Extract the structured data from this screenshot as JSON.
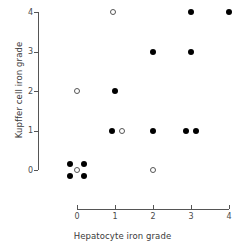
{
  "chart_data": {
    "type": "scatter",
    "title": "",
    "xlabel": "Hepatocyte iron grade",
    "ylabel": "Kupffer cell iron grade",
    "xlim": [
      0,
      4
    ],
    "ylim": [
      0,
      4
    ],
    "xticks": [
      "0",
      "1",
      "2",
      "3",
      "4"
    ],
    "yticks": [
      "0",
      "1",
      "2",
      "3",
      "4"
    ],
    "grid": false,
    "legend": "none",
    "series": [
      {
        "name": "filled-marker",
        "marker": "filled-circle",
        "color": "#000000",
        "points": [
          {
            "x": 0,
            "y": 0,
            "jx": -0.18,
            "jy": 0.16
          },
          {
            "x": 0,
            "y": 0,
            "jx": 0.18,
            "jy": 0.16
          },
          {
            "x": 0,
            "y": 0,
            "jx": -0.18,
            "jy": -0.16
          },
          {
            "x": 0,
            "y": 0,
            "jx": 0.18,
            "jy": -0.16
          },
          {
            "x": 1,
            "y": 1,
            "jx": -0.08,
            "jy": 0.0
          },
          {
            "x": 1,
            "y": 2,
            "jx": 0.0,
            "jy": 0.0
          },
          {
            "x": 2,
            "y": 1,
            "jx": 0.0,
            "jy": 0.0
          },
          {
            "x": 2,
            "y": 3,
            "jx": 0.0,
            "jy": 0.0
          },
          {
            "x": 3,
            "y": 1,
            "jx": -0.12,
            "jy": 0.0
          },
          {
            "x": 3,
            "y": 1,
            "jx": 0.14,
            "jy": 0.0
          },
          {
            "x": 3,
            "y": 3,
            "jx": 0.0,
            "jy": 0.0
          },
          {
            "x": 3,
            "y": 4,
            "jx": 0.0,
            "jy": 0.0
          },
          {
            "x": 4,
            "y": 4,
            "jx": 0.0,
            "jy": 0.0
          }
        ]
      },
      {
        "name": "open-marker",
        "marker": "open-circle",
        "color": "#555555",
        "points": [
          {
            "x": 0,
            "y": 0,
            "jx": 0.0,
            "jy": 0.0
          },
          {
            "x": 0,
            "y": 2,
            "jx": 0.0,
            "jy": 0.0
          },
          {
            "x": 1,
            "y": 1,
            "jx": 0.18,
            "jy": 0.0
          },
          {
            "x": 1,
            "y": 4,
            "jx": -0.06,
            "jy": 0.0
          },
          {
            "x": 2,
            "y": 0,
            "jx": 0.0,
            "jy": 0.0
          }
        ]
      }
    ]
  }
}
